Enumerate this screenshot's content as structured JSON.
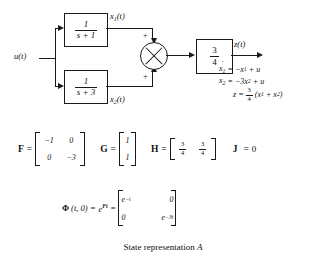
{
  "figure": {
    "caption_text": "State representation",
    "caption_label": "A",
    "domain": "control-systems-block-diagram"
  },
  "diagram": {
    "input_label": "u(t)",
    "output_label": "z(t)",
    "state1_label": "x",
    "state1_sub": "1",
    "state1_suffix": "(t)",
    "state2_label": "x",
    "state2_sub": "2",
    "state2_suffix": "(t)",
    "block1": {
      "numerator": "1",
      "denominator": "s + 1"
    },
    "block2": {
      "numerator": "1",
      "denominator": "s + 3"
    },
    "gain_block": {
      "numerator": "3",
      "denominator": "4"
    },
    "summing_junction": {
      "name": "summing-junction",
      "sign_top": "+",
      "sign_bottom": "+"
    }
  },
  "equations": {
    "eq1": {
      "lhs_var": "x",
      "lhs_sub": "1",
      "dot": "˙",
      "rhs": "= −x₁ + u",
      "rhs_parts": {
        "eq": "=",
        "term1": "−x",
        "term1_sub": "1",
        "plus": "+",
        "term2": "u"
      }
    },
    "eq2": {
      "lhs_var": "x",
      "lhs_sub": "2",
      "dot": "˙",
      "rhs_parts": {
        "eq": "=",
        "term1": "−3x",
        "term1_sub": "2",
        "plus": "+",
        "term2": "u"
      }
    },
    "eq3": {
      "lhs": "z",
      "eq": "=",
      "coef_num": "3",
      "coef_den": "4",
      "open": "(",
      "t1": "x",
      "t1_sub": "1",
      "plus": "+",
      "t2": "x",
      "t2_sub": "2",
      "close": ")"
    }
  },
  "matrices": {
    "F": {
      "name": "F",
      "eq": "=",
      "rows": [
        [
          "−1",
          "0"
        ],
        [
          "0",
          "−3"
        ]
      ]
    },
    "G": {
      "name": "G",
      "eq": "=",
      "rows": [
        [
          "1"
        ],
        [
          "1"
        ]
      ]
    },
    "H": {
      "name": "H",
      "eq": "=",
      "cells": [
        {
          "num": "3",
          "den": "4"
        },
        {
          "num": "3",
          "den": "4"
        }
      ]
    },
    "J": {
      "name": "J",
      "eq": "=",
      "value": "0"
    }
  },
  "phi": {
    "symbol": "Φ",
    "args": "(t, 0)",
    "eq1": "=",
    "exp_base": "e",
    "exp_sup": "Ft",
    "eq2": "=",
    "entries": [
      {
        "base": "e",
        "sup": "−t"
      },
      {
        "plain": "0"
      },
      {
        "plain": "0"
      },
      {
        "base": "e",
        "sup": "−3t"
      }
    ]
  },
  "colors": {
    "ink": "#1a1a1a",
    "background": "#ffffff"
  }
}
